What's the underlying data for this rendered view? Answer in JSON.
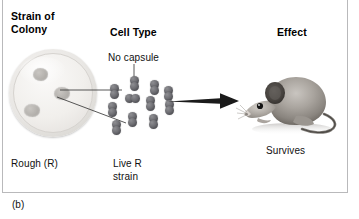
{
  "figure": {
    "panel_label": "(b)",
    "headings": {
      "strain": "Strain of\nColony",
      "strain_line1": "Strain of",
      "strain_line2": "Colony",
      "cell_type": "Cell Type",
      "effect": "Effect"
    },
    "captions": {
      "no_capsule": "No capsule",
      "rough": "Rough (R)",
      "live_r_line1": "Live R",
      "live_r_line2": "strain",
      "survives": "Survives"
    },
    "illustrations": {
      "petri_dish": {
        "name": "petri-dish",
        "colony_count": 3,
        "colony_appearance": "rough"
      },
      "bacteria": {
        "name": "diplococci-cluster",
        "cell_count": 11,
        "capsule": "none",
        "morphology": "diplococcus"
      },
      "arrow": {
        "name": "injection-arrow",
        "direction": "right"
      },
      "mouse": {
        "name": "laboratory-mouse",
        "state": "alive"
      }
    },
    "colors": {
      "text": "#000000",
      "caption_text": "#111111",
      "frame_border": "#b9b9bb",
      "bacteria": "#4b4b50",
      "arrow": "#1a1a1a",
      "dish_fill": "#efedea",
      "colony_fill": "#b4b1ad",
      "background": "#ffffff"
    }
  }
}
